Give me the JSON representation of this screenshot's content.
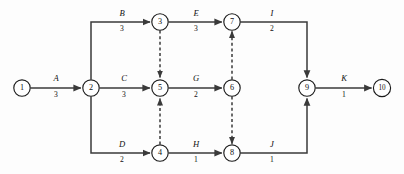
{
  "diagram": {
    "type": "activity-on-arrow-network",
    "canvas": {
      "width": 404,
      "height": 174
    },
    "colors": {
      "background": "#fdfdfd",
      "edge": "#3a3a3a",
      "node_stroke": "#1b1b1b",
      "node_fill": "#ffffff",
      "text": "#111111"
    },
    "node_radius": 8.2,
    "nodes": [
      {
        "id": "1",
        "label": "1",
        "x": 22,
        "y": 88
      },
      {
        "id": "2",
        "label": "2",
        "x": 91,
        "y": 88
      },
      {
        "id": "3",
        "label": "3",
        "x": 160,
        "y": 22
      },
      {
        "id": "4",
        "label": "4",
        "x": 160,
        "y": 153
      },
      {
        "id": "5",
        "label": "5",
        "x": 160,
        "y": 88
      },
      {
        "id": "6",
        "label": "6",
        "x": 232,
        "y": 88
      },
      {
        "id": "7",
        "label": "7",
        "x": 232,
        "y": 22
      },
      {
        "id": "8",
        "label": "8",
        "x": 232,
        "y": 153
      },
      {
        "id": "9",
        "label": "9",
        "x": 307,
        "y": 88
      },
      {
        "id": "10",
        "label": "10",
        "x": 382,
        "y": 88
      }
    ],
    "activities": [
      {
        "name": "A",
        "duration": "3",
        "from": "1",
        "to": "2",
        "label_x": 56,
        "label_name_y": 81,
        "label_dur_y": 97
      },
      {
        "name": "B",
        "duration": "3",
        "from": "2",
        "to": "3",
        "label_x": 122,
        "label_name_y": 16,
        "label_dur_y": 31
      },
      {
        "name": "C",
        "duration": "3",
        "from": "2",
        "to": "5",
        "label_x": 124,
        "label_name_y": 81,
        "label_dur_y": 97
      },
      {
        "name": "D",
        "duration": "2",
        "from": "2",
        "to": "4",
        "label_x": 122,
        "label_name_y": 147,
        "label_dur_y": 162
      },
      {
        "name": "E",
        "duration": "3",
        "from": "3",
        "to": "7",
        "label_x": 196,
        "label_name_y": 16,
        "label_dur_y": 31
      },
      {
        "name": "G",
        "duration": "2",
        "from": "5",
        "to": "6",
        "label_x": 196,
        "label_name_y": 81,
        "label_dur_y": 97
      },
      {
        "name": "H",
        "duration": "1",
        "from": "4",
        "to": "8",
        "label_x": 196,
        "label_name_y": 147,
        "label_dur_y": 162
      },
      {
        "name": "I",
        "duration": "2",
        "from": "7",
        "to": "9",
        "label_x": 272,
        "label_name_y": 16,
        "label_dur_y": 31
      },
      {
        "name": "J",
        "duration": "1",
        "from": "8",
        "to": "9",
        "label_x": 272,
        "label_name_y": 147,
        "label_dur_y": 162
      },
      {
        "name": "K",
        "duration": "1",
        "from": "9",
        "to": "10",
        "label_x": 344,
        "label_name_y": 81,
        "label_dur_y": 97
      }
    ],
    "dummy_activities": [
      {
        "from": "3",
        "to": "5",
        "direction": "down"
      },
      {
        "from": "4",
        "to": "5",
        "direction": "up"
      },
      {
        "from": "6",
        "to": "7",
        "direction": "up"
      },
      {
        "from": "6",
        "to": "8",
        "direction": "down"
      }
    ]
  }
}
